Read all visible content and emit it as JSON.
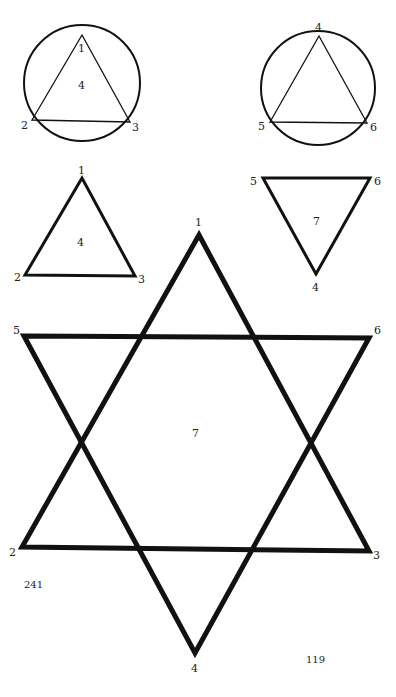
{
  "colors": {
    "ink": "#111111",
    "background": "#ffffff"
  },
  "figures": {
    "circle_left": {
      "vertex_labels": [
        "1",
        "2",
        "3"
      ],
      "center_label": "4"
    },
    "circle_right": {
      "vertex_labels": [
        "4",
        "5",
        "6"
      ]
    },
    "triangle_up": {
      "vertex_labels": [
        "1",
        "2",
        "3"
      ],
      "center_label": "4"
    },
    "triangle_down": {
      "vertex_labels": [
        "5",
        "6",
        "4"
      ],
      "center_label": "7"
    },
    "hexagram": {
      "up_triangle_labels": [
        "1",
        "2",
        "3"
      ],
      "down_triangle_labels": [
        "5",
        "6",
        "4"
      ],
      "center_label": "7"
    }
  },
  "page_numbers": {
    "left": "241",
    "right": "119"
  }
}
